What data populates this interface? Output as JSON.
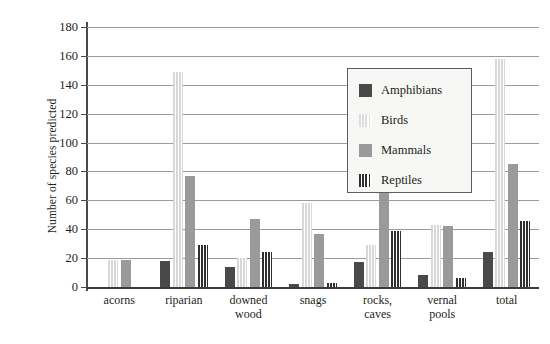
{
  "chart_data": {
    "type": "bar",
    "title": "",
    "xlabel": "",
    "ylabel": "Number of species predicted",
    "ylim": [
      0,
      180
    ],
    "yticks": [
      0,
      20,
      40,
      60,
      80,
      100,
      120,
      140,
      160,
      180
    ],
    "grid": true,
    "legend_position": "inside-top-center",
    "categories": [
      "acorns",
      "riparian",
      "downed\nwood",
      "snags",
      "rocks,\ncaves",
      "vernal\npools",
      "total"
    ],
    "series": [
      {
        "name": "Amphibians",
        "color": "#494949",
        "pattern": "solid",
        "values": [
          0,
          18,
          14,
          2,
          17,
          8,
          24
        ]
      },
      {
        "name": "Birds",
        "color": "#d8d8d8",
        "pattern": "vertical-stripes-light",
        "values": [
          19,
          149,
          20,
          58,
          29,
          43,
          158
        ]
      },
      {
        "name": "Mammals",
        "color": "#9a9a9a",
        "pattern": "solid",
        "values": [
          19,
          77,
          47,
          37,
          67,
          42,
          85
        ]
      },
      {
        "name": "Reptiles",
        "color": "#2f2f2f",
        "pattern": "vertical-stripes-dark",
        "values": [
          0,
          29,
          24,
          3,
          39,
          6,
          46
        ]
      }
    ]
  },
  "legend": {
    "items": [
      {
        "label": "Amphibians"
      },
      {
        "label": "Birds"
      },
      {
        "label": "Mammals"
      },
      {
        "label": "Reptiles"
      }
    ]
  }
}
